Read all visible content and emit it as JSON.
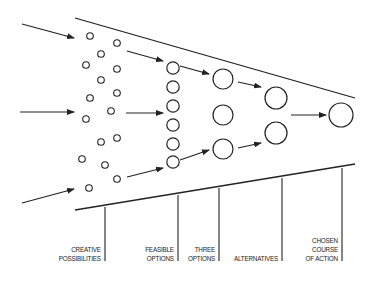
{
  "diagram": {
    "type": "funnel",
    "colors": {
      "stroke": "#222222",
      "background": "#ffffff"
    },
    "stages": [
      {
        "id": "creative",
        "label_lines": [
          "CREATIVE",
          "POSSIBILITIES"
        ]
      },
      {
        "id": "feasible",
        "label_lines": [
          "FEASIBLE",
          "OPTIONS"
        ]
      },
      {
        "id": "three",
        "label_lines": [
          "THREE",
          "OPTIONS"
        ]
      },
      {
        "id": "alternatives",
        "label_lines": [
          "ALTERNATIVES"
        ]
      },
      {
        "id": "chosen",
        "label_lines": [
          "CHOSEN",
          "COURSE",
          "OF ACTION"
        ]
      }
    ]
  }
}
